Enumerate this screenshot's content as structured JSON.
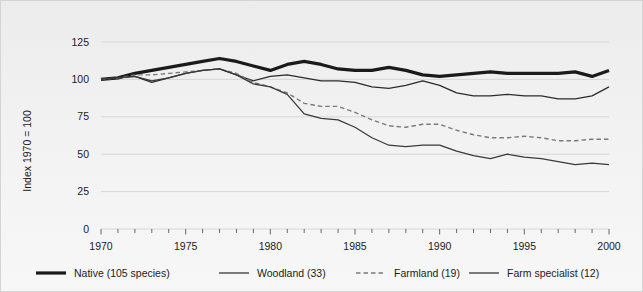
{
  "chart_data": {
    "type": "line",
    "title": "",
    "subtitle": "",
    "xlabel": "",
    "ylabel": "Index 1970 = 100",
    "xlim": [
      1970,
      2000
    ],
    "ylim": [
      0,
      125
    ],
    "grid": true,
    "legend_position": "bottom",
    "y_ticks": [
      0,
      25,
      50,
      75,
      100,
      125
    ],
    "y_tick_labels": [
      "0",
      "25",
      "50",
      "75",
      "100",
      "125"
    ],
    "x_ticks": [
      1970,
      1975,
      1980,
      1985,
      1990,
      1995,
      2000
    ],
    "x_tick_labels": [
      "1970",
      "1975",
      "1980",
      "1985",
      "1990",
      "1995",
      "2000"
    ],
    "x_minor_tick_interval": 1,
    "x": [
      1970,
      1971,
      1972,
      1973,
      1974,
      1975,
      1976,
      1977,
      1978,
      1979,
      1980,
      1981,
      1982,
      1983,
      1984,
      1985,
      1986,
      1987,
      1988,
      1989,
      1990,
      1991,
      1992,
      1993,
      1994,
      1995,
      1996,
      1997,
      1998,
      1999,
      2000
    ],
    "series": [
      {
        "name": "Native (105 species)",
        "key": "native",
        "color": "#1a1a1a",
        "style": "solid",
        "width": 3.2,
        "values": [
          100,
          101,
          104,
          106,
          108,
          110,
          112,
          114,
          112,
          109,
          106,
          110,
          112,
          110,
          107,
          106,
          106,
          108,
          106,
          103,
          102,
          103,
          104,
          105,
          104,
          104,
          104,
          104,
          105,
          102,
          106
        ]
      },
      {
        "name": "Woodland (33)",
        "key": "woodland",
        "color": "#2b2b2b",
        "style": "solid",
        "width": 1.2,
        "values": [
          100,
          101,
          102,
          98,
          101,
          104,
          106,
          107,
          103,
          99,
          102,
          103,
          101,
          99,
          99,
          98,
          95,
          94,
          96,
          99,
          96,
          91,
          89,
          89,
          90,
          89,
          89,
          87,
          87,
          89,
          95
        ]
      },
      {
        "name": "Farmland (19)",
        "key": "farmland",
        "color": "#7a7a7a",
        "style": "dashed",
        "width": 1.4,
        "values": [
          100,
          101,
          103,
          103,
          104,
          105,
          106,
          107,
          104,
          98,
          95,
          91,
          84,
          82,
          82,
          78,
          73,
          69,
          68,
          70,
          70,
          66,
          63,
          61,
          61,
          62,
          61,
          59,
          59,
          60,
          60
        ]
      },
      {
        "name": "Farm specialist (12)",
        "key": "farm_specialist",
        "color": "#3a3a3a",
        "style": "solid",
        "width": 1.3,
        "values": [
          100,
          101,
          102,
          99,
          101,
          104,
          106,
          107,
          103,
          97,
          95,
          90,
          77,
          74,
          73,
          68,
          61,
          56,
          55,
          56,
          56,
          52,
          49,
          47,
          50,
          48,
          47,
          45,
          43,
          44,
          43
        ]
      }
    ],
    "legend": [
      {
        "label": "Native (105 species)",
        "color": "#1a1a1a",
        "style": "solid",
        "width": 3.2
      },
      {
        "label": "Woodland (33)",
        "color": "#2b2b2b",
        "style": "solid",
        "width": 1.2
      },
      {
        "label": "Farmland (19)",
        "color": "#7a7a7a",
        "style": "dashed",
        "width": 1.4
      },
      {
        "label": "Farm specialist (12)",
        "color": "#3a3a3a",
        "style": "solid",
        "width": 1.3
      }
    ]
  }
}
